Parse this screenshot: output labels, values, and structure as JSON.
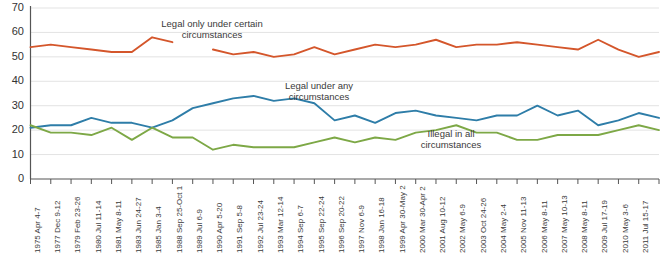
{
  "chart_data": {
    "type": "line",
    "title": "",
    "subtitle": "",
    "xlabel": "",
    "ylabel": "",
    "ylim": [
      0,
      70
    ],
    "yticks": [
      0,
      10,
      20,
      30,
      40,
      50,
      60,
      70
    ],
    "grid": true,
    "legend_position": "inline-annotations",
    "colors": {
      "legal_only_under_certain": "#D4562B",
      "legal_under_any": "#2E7DA8",
      "illegal_in_all": "#7DA846",
      "axis": "#555555",
      "gridline": "#E3E3E3",
      "text": "#333333"
    },
    "categories": [
      "1975 Apr 4-7",
      "1977 Dec 9-12",
      "1979 Feb 23-26",
      "1980 Jul 11-14",
      "1981 May 8-11",
      "1983 Jun 24-27",
      "1985 Jan 3-4",
      "1988 Sep 25-Oct 1",
      "1989 Jul 6-9",
      "1990 Apr 5-20",
      "1991 Sep 5-8",
      "1992 Jul 23-24",
      "1993 Mar 12-14",
      "1994 Sep 6-7",
      "1995 Sep 22-24",
      "1996 Sep 20-22",
      "1997 Nov 6-9",
      "1998 Jan 16-18",
      "1999 Apr 30-May 2",
      "2000 Mar 30-Apr 2",
      "2001 Aug 10-12",
      "2002 May 6-9",
      "2003 Oct 24-26",
      "2004 May 2-4",
      "2005 Nov 11-13",
      "2006 May 8-11",
      "2007 May 10-13",
      "2008 May 8-11",
      "2009 Jul 17-19",
      "2010 May 3-6",
      "2011 Jul 15-17",
      "2012 May 3-6"
    ],
    "series": [
      {
        "name": "Legal only under certain circumstances",
        "color": "#D4562B",
        "values": [
          54,
          55,
          54,
          53,
          52,
          52,
          58,
          56,
          null,
          53,
          51,
          52,
          50,
          51,
          54,
          51,
          53,
          55,
          54,
          55,
          57,
          54,
          55,
          55,
          56,
          55,
          54,
          53,
          57,
          53,
          50,
          52
        ]
      },
      {
        "name": "Legal under any circumstances",
        "color": "#2E7DA8",
        "values": [
          21,
          22,
          22,
          25,
          23,
          23,
          21,
          24,
          29,
          31,
          33,
          34,
          32,
          33,
          31,
          24,
          26,
          23,
          27,
          28,
          26,
          25,
          24,
          26,
          26,
          30,
          26,
          28,
          22,
          24,
          27,
          25
        ]
      },
      {
        "name": "Illegal in all circumstances",
        "color": "#7DA846",
        "values": [
          22,
          19,
          19,
          18,
          21,
          16,
          21,
          17,
          17,
          12,
          14,
          13,
          13,
          13,
          15,
          17,
          15,
          17,
          16,
          19,
          20,
          22,
          19,
          19,
          16,
          16,
          18,
          18,
          18,
          20,
          22,
          20
        ]
      }
    ],
    "annotations": [
      {
        "id": "annot-legal-certain",
        "line1": "Legal only under certain",
        "line2": "circumstances",
        "series": "Legal only under certain circumstances"
      },
      {
        "id": "annot-legal-any",
        "line1": "Legal under any",
        "line2": "circumstances",
        "series": "Legal under any circumstances"
      },
      {
        "id": "annot-illegal-all",
        "line1": "Illegal in all",
        "line2": "circumstances",
        "series": "Illegal in all circumstances"
      }
    ]
  }
}
